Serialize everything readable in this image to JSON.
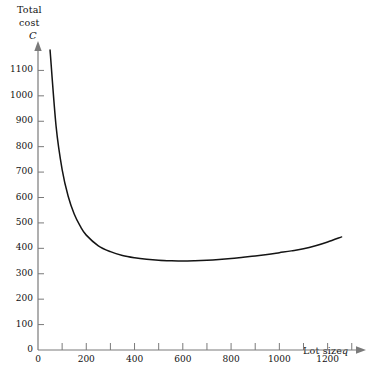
{
  "chart_data": {
    "type": "line",
    "title": "",
    "ylabel": "Total cost C",
    "ylabel_lines": [
      "Total",
      "cost",
      "C"
    ],
    "xlabel": "Lot size q",
    "xlabel_main": "Lot size",
    "xlabel_symbol": "q",
    "xlim": [
      0,
      1330
    ],
    "ylim": [
      0,
      1200
    ],
    "grid": false,
    "legend": null,
    "axis_arrows": true,
    "x_major_ticks": [
      0,
      200,
      400,
      600,
      800,
      1000,
      1200
    ],
    "x_major_tick_labels": [
      "0",
      "200",
      "400",
      "600",
      "800",
      "1000",
      "1200"
    ],
    "x_minor_ticks": [
      100,
      300,
      500,
      700,
      900,
      1100,
      1300
    ],
    "y_major_ticks": [
      0,
      100,
      200,
      300,
      400,
      500,
      600,
      700,
      800,
      900,
      1000,
      1100
    ],
    "y_major_tick_labels": [
      "0",
      "100",
      "200",
      "300",
      "400",
      "500",
      "600",
      "700",
      "800",
      "900",
      "1000",
      "1100"
    ],
    "series": [
      {
        "name": "Total cost",
        "color": "#141414",
        "x": [
          50,
          75,
          100,
          125,
          150,
          175,
          200,
          250,
          300,
          350,
          400,
          450,
          500,
          550,
          600,
          650,
          700,
          750,
          800,
          850,
          900,
          950,
          1000,
          1050,
          1100,
          1150,
          1200,
          1258
        ],
        "y": [
          1180,
          880,
          710,
          605,
          535,
          487,
          452,
          410,
          387,
          372,
          363,
          357,
          353,
          351,
          350,
          351,
          353,
          356,
          360,
          365,
          370,
          376,
          383,
          390,
          398,
          410,
          425,
          445
        ]
      }
    ],
    "annotations": {
      "minimum_q": 600,
      "minimum_cost": 350
    },
    "colors": {
      "axis": "#7a7a7a",
      "curve": "#141414",
      "text": "#111111",
      "background": "#ffffff"
    }
  }
}
